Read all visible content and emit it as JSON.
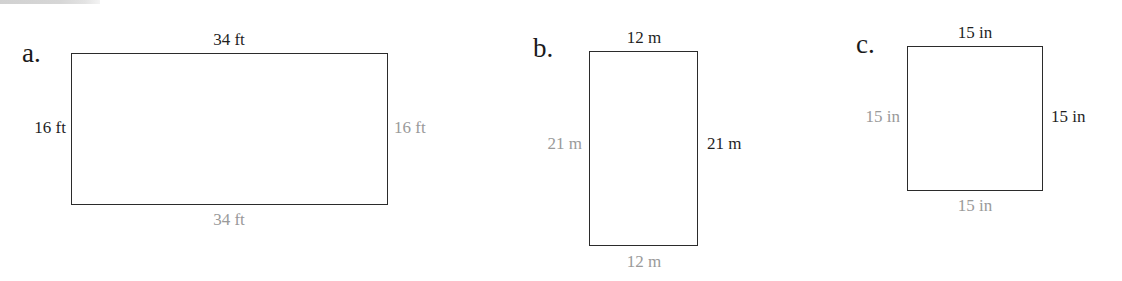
{
  "page": {
    "background_color": "#ffffff",
    "stroke_color": "#2b2b2b",
    "dark_label_color": "#1f1f1f",
    "gray_label_color": "#9a9a9a"
  },
  "figures": [
    {
      "letter": "a.",
      "shape": "rectangle",
      "unit": "ft",
      "width_value": "34",
      "height_value": "16",
      "labels": {
        "top": "34 ft",
        "bottom": "34 ft",
        "left": "16 ft",
        "right": "16 ft"
      },
      "label_styles": {
        "top": "dark",
        "bottom": "gray",
        "left": "dark",
        "right": "gray"
      }
    },
    {
      "letter": "b.",
      "shape": "rectangle",
      "unit": "m",
      "width_value": "12",
      "height_value": "21",
      "labels": {
        "top": "12 m",
        "bottom": "12 m",
        "left": "21 m",
        "right": "21 m"
      },
      "label_styles": {
        "top": "dark",
        "bottom": "gray",
        "left": "gray",
        "right": "dark"
      }
    },
    {
      "letter": "c.",
      "shape": "square",
      "unit": "in",
      "width_value": "15",
      "height_value": "15",
      "labels": {
        "top": "15 in",
        "bottom": "15 in",
        "left": "15 in",
        "right": "15 in"
      },
      "label_styles": {
        "top": "dark",
        "bottom": "gray",
        "left": "gray",
        "right": "dark"
      }
    }
  ]
}
